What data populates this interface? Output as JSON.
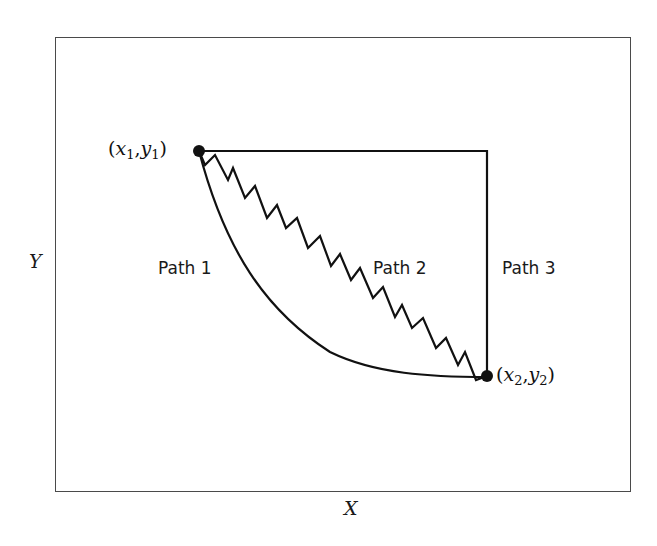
{
  "diagram": {
    "type": "path-comparison",
    "axes": {
      "x_label": "X",
      "y_label": "Y"
    },
    "points": {
      "start": {
        "x_sym": "x",
        "y_sym": "y",
        "sub": "1",
        "label": "(x1,y1)"
      },
      "end": {
        "x_sym": "x",
        "y_sym": "y",
        "sub": "2",
        "label": "(x2,y2)"
      }
    },
    "paths": [
      {
        "id": "path1",
        "label": "Path 1",
        "shape": "smooth curve (convex, bowing down-left)"
      },
      {
        "id": "path2",
        "label": "Path 2",
        "shape": "zigzag diagonal"
      },
      {
        "id": "path3",
        "label": "Path 3",
        "shape": "horizontal then vertical (right angle)"
      }
    ],
    "colors": {
      "stroke": "#111111",
      "frame": "#4a4a4a",
      "background": "#ffffff"
    }
  }
}
